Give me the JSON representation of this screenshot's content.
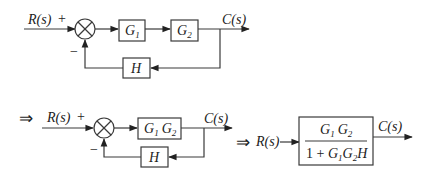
{
  "diagram": {
    "stage1": {
      "input": "R(s)",
      "plus_sign": "+",
      "minus_sign": "−",
      "blocks": [
        {
          "name": "G",
          "sub": "1"
        },
        {
          "name": "G",
          "sub": "2"
        }
      ],
      "feedback_block": "H",
      "output": "C(s)"
    },
    "stage2": {
      "implies": "⇒",
      "input": "R(s)",
      "plus_sign": "+",
      "minus_sign": "−",
      "forward_block": {
        "parts": [
          {
            "name": "G",
            "sub": "1"
          },
          {
            "name": "G",
            "sub": "2"
          }
        ]
      },
      "feedback_block": "H",
      "output": "C(s)"
    },
    "stage3": {
      "implies": "⇒",
      "input": "R(s)",
      "numerator": {
        "parts": [
          {
            "name": "G",
            "sub": "1"
          },
          {
            "name": "G",
            "sub": "2"
          }
        ]
      },
      "denominator": {
        "prefix": "1 + ",
        "parts": [
          {
            "name": "G",
            "sub": "1"
          },
          {
            "name": "G",
            "sub": "2"
          }
        ],
        "suffix": "H"
      },
      "output": "C(s)"
    }
  }
}
